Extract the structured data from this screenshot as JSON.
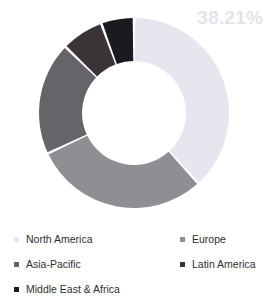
{
  "chart_data": {
    "type": "pie",
    "variant": "donut",
    "title": "",
    "xlabel": "",
    "ylabel": "",
    "units": "percent",
    "start_angle_deg": 0,
    "direction": "clockwise",
    "outer_radius": 95,
    "inner_radius": 52,
    "center": [
      134,
      113
    ],
    "legend_position": "bottom",
    "grid": false,
    "categories": [
      "North America",
      "Europe",
      "Asia-Pacific",
      "Latin America",
      "Middle East & Africa"
    ],
    "values": [
      38.21,
      29.8,
      19.2,
      7.2,
      5.59
    ],
    "colors": [
      "#e6e6ee",
      "#8e8e93",
      "#646469",
      "#3a3439",
      "#1a1a1f"
    ],
    "annotations": [
      {
        "text": "38.21%",
        "series": "North America",
        "position": "top-right",
        "color": "#e4e4ea"
      }
    ]
  },
  "label": {
    "value_text": "38.21%"
  },
  "legend": {
    "items": [
      {
        "label": "North America",
        "color": "#e6e6ee"
      },
      {
        "label": "Europe",
        "color": "#8e8e93"
      },
      {
        "label": "Asia-Pacific",
        "color": "#646469"
      },
      {
        "label": "Latin America",
        "color": "#3a3439"
      },
      {
        "label": "Middle East & Africa",
        "color": "#1a1a1f"
      }
    ]
  }
}
